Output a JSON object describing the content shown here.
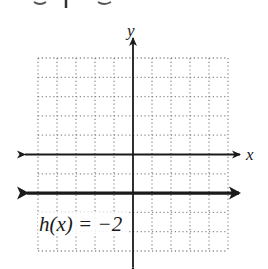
{
  "chart_data": {
    "type": "line",
    "title": "",
    "xlabel": "x",
    "ylabel": "y",
    "xlim": [
      -5,
      5
    ],
    "ylim": [
      -5,
      5
    ],
    "grid": true,
    "grid_style": "dotted",
    "tick_step": 1,
    "tick_labels": false,
    "series": [
      {
        "name": "h(x) = -2",
        "equation": "h(x) = -2",
        "kind": "horizontal line",
        "x": [
          -5,
          5
        ],
        "values": [
          -2,
          -2
        ],
        "arrows_both_ends": true
      }
    ],
    "annotations": [
      {
        "text": "h(x) = −2",
        "x": -4.9,
        "y": -3.6
      }
    ]
  },
  "labels": {
    "x_axis": "x",
    "y_axis": "y",
    "function": "h(x) = −2"
  },
  "colors": {
    "ink": "#1a1a1a",
    "grid": "#8a8a8a",
    "background": "#ffffff"
  }
}
